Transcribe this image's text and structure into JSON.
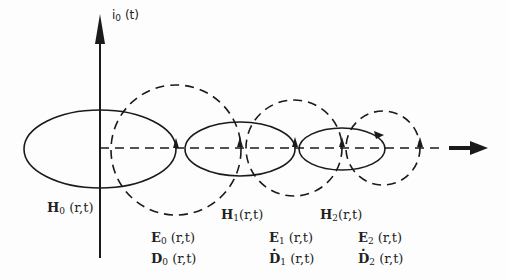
{
  "diagram": {
    "axis_label": {
      "base": "i",
      "sub": "0",
      "arg": "(t)"
    },
    "magnetic_fields": [
      {
        "symbol": "H",
        "sub": "0",
        "arg": "(r,t)"
      },
      {
        "symbol": "H",
        "sub": "1",
        "arg": "(r,t)"
      },
      {
        "symbol": "H",
        "sub": "2",
        "arg": "(r,t)"
      }
    ],
    "electric_fields": [
      {
        "symbol": "E",
        "sub": "0",
        "arg": "(r,t)"
      },
      {
        "symbol": "E",
        "sub": "1",
        "arg": "(r,t)"
      },
      {
        "symbol": "E",
        "sub": "2",
        "arg": "(r,t)"
      }
    ],
    "displacement_fields": [
      {
        "symbol": "D",
        "sub": "0",
        "arg": "(r,t)",
        "dotted": false
      },
      {
        "symbol": "D",
        "sub": "1",
        "arg": "(r,t)",
        "dotted": true
      },
      {
        "symbol": "D",
        "sub": "2",
        "arg": "(r,t)",
        "dotted": true
      }
    ],
    "colors": {
      "ink": "#1a1a1a",
      "background": "#fdfdfd"
    }
  }
}
